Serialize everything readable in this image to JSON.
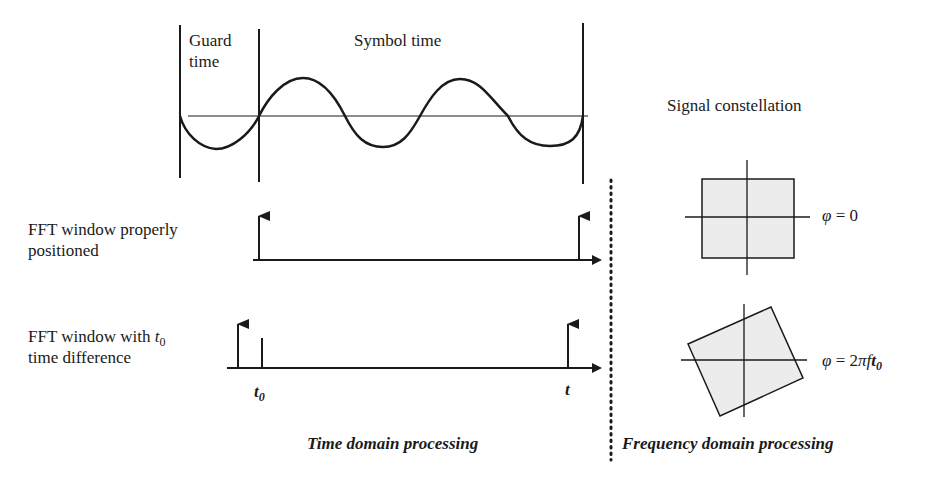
{
  "waveform": {
    "guard_label_line1": "Guard",
    "guard_label_line2": "time",
    "symbol_label": "Symbol time"
  },
  "timelines": {
    "proper": {
      "label_line1": "FFT window properly",
      "label_line2": "positioned"
    },
    "offset": {
      "label_line1_prefix": "FFT window with ",
      "label_line1_var": "t",
      "label_line1_sub": "0",
      "label_line2": "time difference",
      "tick_t0_var": "t",
      "tick_t0_sub": "0",
      "tick_t": "t"
    }
  },
  "constellation": {
    "title": "Signal constellation",
    "phase0": {
      "phi": "φ",
      "eq": " = 0"
    },
    "phase_shift": {
      "phi": "φ",
      "eq": " = 2",
      "pi": "π",
      "f": "f",
      "t": "t",
      "sub": "0"
    }
  },
  "sections": {
    "time_domain": "Time domain processing",
    "frequency_domain": "Frequency domain processing"
  },
  "colors": {
    "ink": "#1a1a1a",
    "fill": "#ececec",
    "background": "#ffffff"
  }
}
